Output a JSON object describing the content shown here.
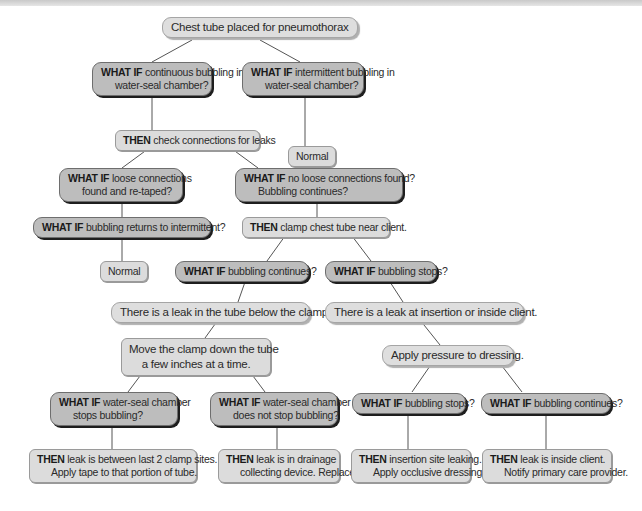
{
  "title": "Chest tube placed for pneumothorax",
  "nodes": {
    "root": {
      "text": "Chest tube placed for pneumothorax"
    },
    "continuous": {
      "prefix": "WHAT IF",
      "line1": "continuous bubbling in",
      "line2": "water-seal chamber?"
    },
    "intermittent": {
      "prefix": "WHAT IF",
      "line1": "intermittent bubbling in",
      "line2": "water-seal chamber?"
    },
    "normal1": {
      "text": "Normal"
    },
    "check_connections": {
      "prefix": "THEN",
      "line1": "check connections for leaks"
    },
    "loose_found": {
      "prefix": "WHAT IF",
      "line1": "loose connections",
      "line2": "found and re-taped?"
    },
    "no_loose": {
      "prefix": "WHAT IF",
      "line1": "no loose connections found?",
      "line2": "Bubbling continues?"
    },
    "returns_intermittent": {
      "prefix": "WHAT IF",
      "line1": "bubbling returns to intermittent?"
    },
    "clamp_tube": {
      "prefix": "THEN",
      "line1": "clamp chest tube near client."
    },
    "normal2": {
      "text": "Normal"
    },
    "bubbling_continues_1": {
      "prefix": "WHAT IF",
      "line1": "bubbling continues?"
    },
    "bubbling_stops_1": {
      "prefix": "WHAT IF",
      "line1": "bubbling stops?"
    },
    "leak_below_clamp": {
      "text": "There is a leak in the tube below the clamp."
    },
    "leak_insertion": {
      "text": "There is a leak at insertion or inside client."
    },
    "move_clamp": {
      "line1": "Move the clamp down the tube",
      "line2": "a few inches at a time."
    },
    "apply_pressure": {
      "text": "Apply pressure to dressing."
    },
    "stops_bubbling": {
      "prefix": "WHAT IF",
      "line1": "water-seal chamber",
      "line2": "stops bubbling?"
    },
    "not_stop_bubbling": {
      "prefix": "WHAT IF",
      "line1": "water-seal chamber",
      "line2": "does not stop bubbling?"
    },
    "bubbling_stops_2": {
      "prefix": "WHAT IF",
      "line1": "bubbling stops?"
    },
    "bubbling_continues_2": {
      "prefix": "WHAT IF",
      "line1": "bubbling continues?"
    },
    "leak_between_clamps": {
      "prefix": "THEN",
      "line1": "leak is between last 2 clamp sites.",
      "line2": "Apply tape to that portion of tube."
    },
    "leak_drainage": {
      "prefix": "THEN",
      "line1": "leak is in drainage",
      "line2": "collecting device. Replace."
    },
    "insertion_leaking": {
      "prefix": "THEN",
      "line1": "insertion site leaking.",
      "line2": "Apply occlusive dressing."
    },
    "inside_client": {
      "prefix": "THEN",
      "line1": "leak is inside client.",
      "line2": "Notify primary care provider."
    }
  },
  "colors": {
    "decision_fill": "#bdbdbd",
    "statement_fill": "#dcdcdc",
    "connector": "#555555"
  }
}
